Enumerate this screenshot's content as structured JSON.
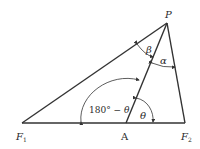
{
  "diagram": {
    "points": {
      "P": {
        "label": "P",
        "x": 167,
        "y": 23
      },
      "F1": {
        "label": "F",
        "sub": "1",
        "x": 22,
        "y": 123
      },
      "A": {
        "label": "A",
        "x": 126,
        "y": 123
      },
      "F2": {
        "label": "F",
        "sub": "2",
        "x": 185,
        "y": 123
      }
    },
    "angles": {
      "beta": "β",
      "alpha": "α",
      "supplement_prefix": "180° − ",
      "supplement_theta": "θ",
      "theta": "θ"
    },
    "colors": {
      "line": "#333333",
      "background": "#ffffff"
    }
  }
}
